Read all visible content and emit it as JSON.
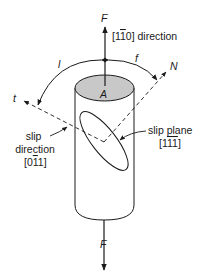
{
  "diagram": {
    "force_top_label": "F",
    "force_bottom_label": "F",
    "direction_label": {
      "pre": "[1",
      "bar": "1",
      "post": "0] direction"
    },
    "area_label": "A",
    "angle_lambda_label": "l",
    "angle_phi_label": "f",
    "normal_label": "N",
    "slip_dir_axis_label": "t",
    "slip_direction": {
      "line1": "slip",
      "line2": "direction",
      "index_pre": "[0",
      "index_bar": "1",
      "index_post": "1]"
    },
    "slip_plane": {
      "line1": "slip plane",
      "index_pre": "[1",
      "index_bar1": "1",
      "index_bar2": "1",
      "index_post": "]"
    },
    "colors": {
      "line": "#1a1a1a",
      "top_face": "#c8c8c8",
      "background": "#ffffff"
    }
  }
}
